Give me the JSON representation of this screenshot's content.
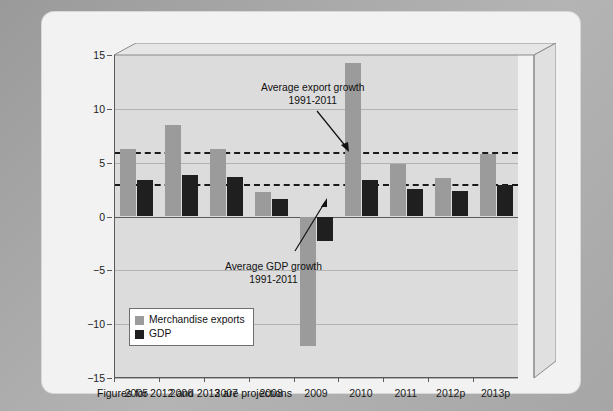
{
  "figure": {
    "footnote": "Figures for 2012 and 2013 are projections"
  },
  "legend": {
    "items": [
      {
        "label": "Merchandise exports",
        "color": "#9b9b9b"
      },
      {
        "label": "GDP",
        "color": "#1f1f1f"
      }
    ]
  },
  "annotations": [
    {
      "id": "export-avg",
      "line1": "Average export growth",
      "line2": "1991-2011"
    },
    {
      "id": "gdp-avg",
      "line1": "Average GDP growth",
      "line2": "1991-2011"
    }
  ],
  "chart_data": {
    "type": "bar",
    "title": "",
    "subtitle": "",
    "xlabel": "",
    "ylabel": "",
    "ylim": [
      -15,
      15
    ],
    "yticks": [
      15,
      10,
      5,
      0,
      -5,
      -10,
      -15
    ],
    "ytick_labels": [
      "15",
      "10",
      "5",
      "0",
      "−5",
      "−10",
      "−15"
    ],
    "grid": true,
    "legend_position": "lower-left",
    "categories": [
      "2005",
      "2006",
      "2007",
      "2008",
      "2009",
      "2010",
      "2011",
      "2012p",
      "2013p"
    ],
    "series": [
      {
        "name": "Merchandise exports",
        "color": "#9b9b9b",
        "values": [
          6.3,
          8.5,
          6.3,
          2.3,
          -12.0,
          14.3,
          4.9,
          3.6,
          5.8
        ]
      },
      {
        "name": "GDP",
        "color": "#1f1f1f",
        "values": [
          3.4,
          3.9,
          3.7,
          1.6,
          -2.3,
          3.4,
          2.6,
          2.4,
          2.9
        ]
      }
    ],
    "reference_lines": [
      {
        "name": "Average export growth 1991-2011",
        "value": 6.0,
        "style": "dashed",
        "color": "#1a1a1a"
      },
      {
        "name": "Average GDP growth 1991-2011",
        "value": 3.0,
        "style": "dashed",
        "color": "#1a1a1a"
      }
    ]
  }
}
